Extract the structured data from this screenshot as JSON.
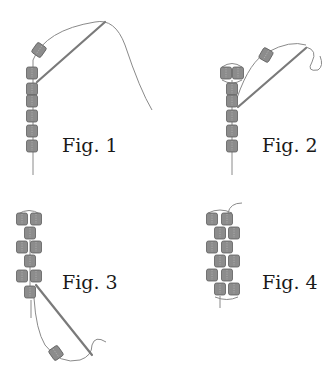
{
  "figures": [
    {
      "id": "fig1",
      "label": "Fig. 1"
    },
    {
      "id": "fig2",
      "label": "Fig. 2"
    },
    {
      "id": "fig3",
      "label": "Fig. 3"
    },
    {
      "id": "fig4",
      "label": "Fig. 4"
    }
  ],
  "colors": {
    "background": "#ffffff",
    "bead": "#8c8c8c",
    "bead_outline": "#5e5e5e",
    "thread": "#8a8a8a",
    "needle": "#7a7a7a",
    "text": "#1a1a1a"
  }
}
